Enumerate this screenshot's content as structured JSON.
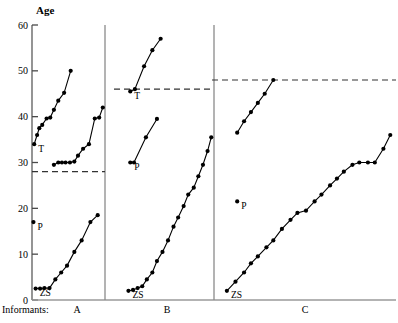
{
  "figure": {
    "y_axis_title": "Age",
    "x_axis_caption": "Informants:",
    "tick_labels": [
      "60",
      "50",
      "40",
      "30",
      "20",
      "10",
      "0"
    ],
    "panel_labels": [
      "A",
      "B",
      "C"
    ],
    "point_labels": [
      "T",
      "P",
      "ZS"
    ]
  },
  "chart_data": {
    "type": "line",
    "title": "Age",
    "subtitle": "",
    "xlabel": "Informants:",
    "ylabel": "Age",
    "ylim": [
      0,
      60
    ],
    "yticks": [
      0,
      10,
      20,
      30,
      40,
      50,
      60
    ],
    "grid": false,
    "legend": "none",
    "marker": "filled-circle",
    "panels": [
      {
        "name": "A",
        "reference_line": 28,
        "reference_line_style": "dashed",
        "xrange_px": [
          32,
          105
        ],
        "series": [
          {
            "name": "A-T-series",
            "anchor_label": "T",
            "anchor_value": 34,
            "x": [
              0.03,
              0.07,
              0.1,
              0.14,
              0.2,
              0.25,
              0.3,
              0.36,
              0.44,
              0.53
            ],
            "values": [
              34,
              36,
              37.5,
              38.2,
              39.6,
              39.8,
              41.5,
              43.5,
              45.2,
              50.0
            ]
          },
          {
            "name": "A-mid-series",
            "anchor_label": "",
            "anchor_value": 29.5,
            "x": [
              0.3,
              0.36,
              0.41,
              0.46,
              0.52,
              0.58,
              0.63,
              0.7,
              0.78,
              0.86,
              0.92,
              0.97
            ],
            "values": [
              29.5,
              30.0,
              30.0,
              30.0,
              30.0,
              30.2,
              31.5,
              33.0,
              34.0,
              39.6,
              39.8,
              42.0,
              44.2,
              45.0
            ]
          },
          {
            "name": "A-ZS-series",
            "anchor_label": "ZS",
            "anchor_value": 2.5,
            "x": [
              0.05,
              0.11,
              0.17,
              0.24,
              0.32,
              0.4,
              0.48,
              0.58,
              0.68,
              0.8,
              0.9
            ],
            "values": [
              2.5,
              2.5,
              2.6,
              2.6,
              4.5,
              6.0,
              7.5,
              10.5,
              13.0,
              17.0,
              18.5,
              20.0
            ]
          },
          {
            "name": "A-P-marker",
            "anchor_label": "P",
            "anchor_value": 17.0,
            "x": [
              0.02
            ],
            "values": [
              17.0
            ]
          }
        ]
      },
      {
        "name": "B",
        "reference_line": 46,
        "reference_line_style": "dashed",
        "xrange_px": [
          122,
          214
        ],
        "series": [
          {
            "name": "B-T-series",
            "anchor_label": "T",
            "anchor_value": 45.5,
            "x": [
              0.09,
              0.14,
              0.24,
              0.33,
              0.42
            ],
            "values": [
              45.5,
              46.0,
              51.0,
              54.5,
              57.0
            ]
          },
          {
            "name": "B-P-series",
            "anchor_label": "P",
            "anchor_value": 30.0,
            "x": [
              0.09,
              0.13,
              0.26,
              0.38
            ],
            "values": [
              30.0,
              30.0,
              35.5,
              39.5
            ]
          },
          {
            "name": "B-ZS-series",
            "anchor_label": "ZS",
            "anchor_value": 2.0,
            "x": [
              0.07,
              0.12,
              0.17,
              0.22,
              0.27,
              0.33,
              0.38,
              0.44,
              0.5,
              0.56,
              0.61,
              0.67,
              0.72,
              0.78,
              0.83,
              0.88,
              0.93,
              0.97
            ],
            "values": [
              2.0,
              2.2,
              2.6,
              3.0,
              4.5,
              6.0,
              8.5,
              10.5,
              13.0,
              16.0,
              18.0,
              20.5,
              23.0,
              24.5,
              27.0,
              29.5,
              32.5,
              35.5,
              38.5,
              40.0
            ]
          }
        ]
      },
      {
        "name": "C",
        "reference_line": 48,
        "reference_line_style": "dashed",
        "xrange_px": [
          220,
          392
        ],
        "series": [
          {
            "name": "C-upper-series",
            "anchor_label": "",
            "anchor_value": 36.5,
            "x": [
              0.1,
              0.14,
              0.18,
              0.22,
              0.26,
              0.31
            ],
            "values": [
              36.5,
              39.0,
              41.0,
              43.0,
              45.0,
              48.0
            ]
          },
          {
            "name": "C-P-marker",
            "anchor_label": "P",
            "anchor_value": 21.5,
            "x": [
              0.1
            ],
            "values": [
              21.5
            ]
          },
          {
            "name": "C-ZS-series",
            "anchor_label": "ZS",
            "anchor_value": 2.0,
            "x": [
              0.04,
              0.09,
              0.14,
              0.18,
              0.22,
              0.27,
              0.31,
              0.36,
              0.41,
              0.45,
              0.5,
              0.55,
              0.59,
              0.64,
              0.68,
              0.72,
              0.77,
              0.81,
              0.86,
              0.9,
              0.95,
              0.99
            ],
            "values": [
              2.0,
              4.0,
              6.0,
              8.0,
              9.5,
              11.5,
              13.0,
              15.5,
              17.5,
              19.0,
              19.5,
              21.5,
              23.0,
              25.0,
              26.5,
              28.0,
              29.5,
              30.0,
              30.0,
              30.0,
              33.0,
              36.0,
              38.5,
              42.0
            ]
          }
        ]
      }
    ]
  }
}
